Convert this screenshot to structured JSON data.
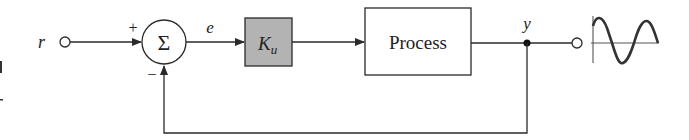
{
  "diagram": {
    "type": "feedback-control-block-diagram",
    "input": {
      "label": "r"
    },
    "summing_junction": {
      "symbol": "Σ",
      "plus_sign": "+",
      "minus_sign": "−"
    },
    "error_signal": {
      "label": "e"
    },
    "gain_block": {
      "label_main": "K",
      "label_sub": "u",
      "fill": "#b3b3b3"
    },
    "process_block": {
      "label": "Process"
    },
    "output": {
      "label": "y"
    },
    "output_waveform": "sine-wave",
    "colors": {
      "line": "#2a2a2a",
      "gain_fill": "#b3b3b3",
      "background": "#ffffff"
    }
  }
}
